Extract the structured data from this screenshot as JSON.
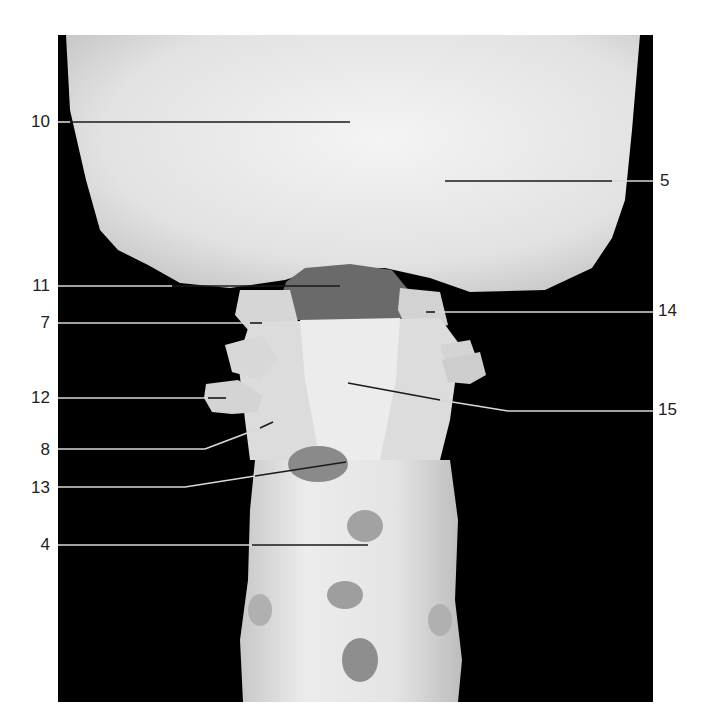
{
  "figure": {
    "photo": {
      "x": 58,
      "y": 35,
      "width": 595,
      "height": 667,
      "background": "#000000"
    },
    "colors": {
      "bone": "#e6e6e6",
      "bone_shadow": "#9a9a9a",
      "cavity": "#5a5a5a",
      "leader_on_dark": "#d8d8d8",
      "leader_on_bone": "#1a1a1a",
      "label_text": "#222222"
    }
  },
  "labels": [
    {
      "id": "10",
      "text": "10",
      "side": "left",
      "lx": 10,
      "ly": 112,
      "line": [
        [
          58,
          122
        ],
        [
          70,
          122
        ],
        [
          350,
          122
        ]
      ]
    },
    {
      "id": "5",
      "text": "5",
      "side": "right",
      "lx": 660,
      "ly": 171,
      "line": [
        [
          653,
          181
        ],
        [
          612,
          181
        ],
        [
          445,
          181
        ]
      ]
    },
    {
      "id": "11",
      "text": "11",
      "side": "left",
      "lx": 10,
      "ly": 276,
      "line": [
        [
          58,
          286
        ],
        [
          172,
          286
        ],
        [
          340,
          286
        ]
      ]
    },
    {
      "id": "14",
      "text": "14",
      "side": "right",
      "lx": 658,
      "ly": 301,
      "line": [
        [
          653,
          312
        ],
        [
          435,
          312
        ],
        [
          426,
          312
        ]
      ]
    },
    {
      "id": "7",
      "text": "7",
      "side": "left",
      "lx": 10,
      "ly": 313,
      "line": [
        [
          58,
          323
        ],
        [
          250,
          323
        ],
        [
          262,
          323
        ]
      ]
    },
    {
      "id": "12",
      "text": "12",
      "side": "left",
      "lx": 10,
      "ly": 388,
      "line": [
        [
          58,
          398
        ],
        [
          208,
          398
        ],
        [
          226,
          398
        ]
      ]
    },
    {
      "id": "15",
      "text": "15",
      "side": "right",
      "lx": 658,
      "ly": 400,
      "line": [
        [
          653,
          411
        ],
        [
          508,
          411
        ],
        [
          440,
          400
        ],
        [
          348,
          383
        ]
      ]
    },
    {
      "id": "8",
      "text": "8",
      "side": "left",
      "lx": 10,
      "ly": 440,
      "line": [
        [
          58,
          449
        ],
        [
          205,
          449
        ],
        [
          260,
          428
        ],
        [
          273,
          422
        ]
      ]
    },
    {
      "id": "13",
      "text": "13",
      "side": "left",
      "lx": 10,
      "ly": 478,
      "line": [
        [
          58,
          487
        ],
        [
          185,
          487
        ],
        [
          255,
          476
        ],
        [
          346,
          462
        ]
      ]
    },
    {
      "id": "4",
      "text": "4",
      "side": "left",
      "lx": 10,
      "ly": 535,
      "line": [
        [
          58,
          545
        ],
        [
          252,
          545
        ],
        [
          368,
          545
        ]
      ]
    }
  ]
}
